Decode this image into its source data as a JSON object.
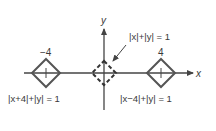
{
  "diagram": {
    "axes": {
      "x_label": "x",
      "y_label": "y"
    },
    "shapes": [
      {
        "name": "left-diamond",
        "center_label": "−4",
        "equation": "|x+4|+|y| = 1",
        "style": "solid"
      },
      {
        "name": "center-diamond",
        "equation": "|x|+|y| = 1",
        "style": "dashed"
      },
      {
        "name": "right-diamond",
        "center_label": "4",
        "equation": "|x−4|+|y| = 1",
        "style": "solid"
      }
    ],
    "colors": {
      "stroke": "#444444",
      "text": "#3a3a3a",
      "background": "#ffffff"
    }
  }
}
